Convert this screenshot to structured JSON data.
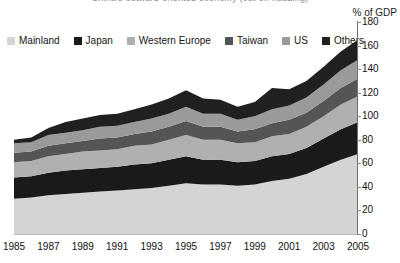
{
  "title": "China's outward-oriented economy (cut-off heading)",
  "y_axis_caption": "% of GDP",
  "legend": {
    "items": [
      {
        "label": "Mainland",
        "color": "#d4d4d4"
      },
      {
        "label": "Japan",
        "color": "#1a1a1a"
      },
      {
        "label": "Western Europe",
        "color": "#b0b0b0"
      },
      {
        "label": "Taiwan",
        "color": "#555555"
      },
      {
        "label": "US",
        "color": "#9a9a9a"
      },
      {
        "label": "Others",
        "color": "#202020"
      }
    ]
  },
  "chart_data": {
    "type": "area",
    "stacked": true,
    "title": "",
    "subtitle": "",
    "xlabel": "",
    "ylabel": "% of GDP",
    "ylim": [
      0,
      180
    ],
    "y_ticks": [
      0,
      20,
      40,
      60,
      80,
      100,
      120,
      140,
      160,
      180
    ],
    "grid": false,
    "legend_position": "top-left",
    "x": [
      1985,
      1986,
      1987,
      1988,
      1989,
      1990,
      1991,
      1992,
      1993,
      1994,
      1995,
      1996,
      1997,
      1998,
      1999,
      2000,
      2001,
      2002,
      2003,
      2004,
      2005
    ],
    "x_tick_labels": [
      "1985",
      "1987",
      "1989",
      "1991",
      "1993",
      "1995",
      "1997",
      "1999",
      "2001",
      "2003",
      "2005"
    ],
    "x_ticks": [
      1985,
      1987,
      1989,
      1991,
      1993,
      1995,
      1997,
      1999,
      2001,
      2003,
      2005
    ],
    "series": [
      {
        "name": "Mainland",
        "color": "#d4d4d4",
        "values": [
          30,
          31,
          33,
          34,
          35,
          36,
          37,
          38,
          39,
          41,
          43,
          42,
          42,
          41,
          42,
          45,
          47,
          51,
          57,
          63,
          68
        ]
      },
      {
        "name": "Japan",
        "color": "#1a1a1a",
        "values": [
          18,
          18,
          19,
          20,
          20,
          20,
          20,
          21,
          21,
          22,
          23,
          21,
          21,
          20,
          20,
          21,
          21,
          22,
          24,
          26,
          27
        ]
      },
      {
        "name": "Western Europe",
        "color": "#b0b0b0",
        "values": [
          13,
          13,
          14,
          14,
          15,
          15,
          15,
          16,
          16,
          17,
          18,
          17,
          17,
          16,
          16,
          17,
          17,
          18,
          19,
          21,
          22
        ]
      },
      {
        "name": "Taiwan",
        "color": "#555555",
        "values": [
          8,
          8,
          9,
          9,
          9,
          10,
          10,
          10,
          11,
          11,
          12,
          11,
          11,
          10,
          11,
          11,
          12,
          12,
          13,
          14,
          15
        ]
      },
      {
        "name": "US",
        "color": "#9a9a9a",
        "values": [
          8,
          8,
          9,
          9,
          9,
          10,
          10,
          10,
          11,
          11,
          12,
          11,
          11,
          10,
          11,
          12,
          12,
          13,
          14,
          15,
          16
        ]
      },
      {
        "name": "Others",
        "color": "#202020",
        "values": [
          3,
          4,
          6,
          9,
          10,
          10,
          10,
          11,
          12,
          13,
          14,
          13,
          12,
          11,
          12,
          18,
          14,
          14,
          15,
          16,
          17
        ]
      }
    ],
    "totals": [
      80,
      82,
      90,
      95,
      98,
      101,
      102,
      106,
      110,
      115,
      122,
      115,
      114,
      108,
      112,
      124,
      123,
      130,
      142,
      155,
      165
    ]
  }
}
